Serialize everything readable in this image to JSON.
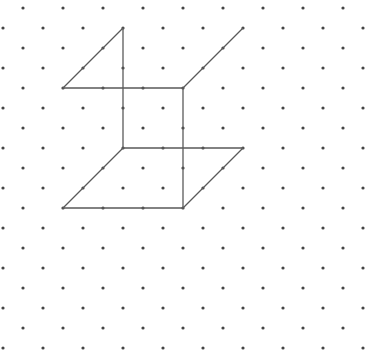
{
  "diagram": {
    "type": "isometric-dot-grid-drawing",
    "width": 365,
    "height": 350,
    "background_color": "#ffffff",
    "dot_color": "#444444",
    "line_color": "#5a5a5a",
    "grid": {
      "row_start_y": 8,
      "row_spacing": 20,
      "row_count": 18,
      "col_spacing": 40,
      "even_row_start_x": 23,
      "odd_row_start_x": 3,
      "dot_radius": 1.6
    },
    "segments": [
      {
        "x1": 123,
        "y1": 28,
        "x2": 123,
        "y2": 148
      },
      {
        "x1": 123,
        "y1": 28,
        "x2": 63,
        "y2": 88
      },
      {
        "x1": 63,
        "y1": 88,
        "x2": 183,
        "y2": 88
      },
      {
        "x1": 183,
        "y1": 88,
        "x2": 243,
        "y2": 28
      },
      {
        "x1": 183,
        "y1": 88,
        "x2": 183,
        "y2": 208
      },
      {
        "x1": 123,
        "y1": 148,
        "x2": 243,
        "y2": 148
      },
      {
        "x1": 243,
        "y1": 148,
        "x2": 183,
        "y2": 208
      },
      {
        "x1": 123,
        "y1": 148,
        "x2": 63,
        "y2": 208
      },
      {
        "x1": 63,
        "y1": 208,
        "x2": 183,
        "y2": 208
      }
    ]
  }
}
